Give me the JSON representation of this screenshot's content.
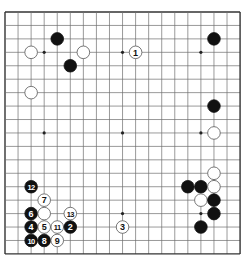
{
  "board": {
    "size": 19,
    "origin_x": 5,
    "origin_y": 12,
    "spacing_x": 13.06,
    "spacing_y": 13.44,
    "line_color": "#6e6e6e",
    "border_color": "#333333",
    "star_points": [
      [
        3,
        3
      ],
      [
        9,
        3
      ],
      [
        15,
        3
      ],
      [
        3,
        9
      ],
      [
        9,
        9
      ],
      [
        15,
        9
      ],
      [
        3,
        15
      ],
      [
        9,
        15
      ],
      [
        15,
        15
      ]
    ]
  },
  "colors": {
    "black": "#111111",
    "white": "#ffffff",
    "stone_outline": "#555555"
  },
  "stones": [
    {
      "color": "black",
      "col": 4,
      "row": 2,
      "label": ""
    },
    {
      "color": "white",
      "col": 2,
      "row": 3,
      "label": ""
    },
    {
      "color": "white",
      "col": 6,
      "row": 3,
      "label": ""
    },
    {
      "color": "black",
      "col": 5,
      "row": 4,
      "label": ""
    },
    {
      "color": "white",
      "col": 2,
      "row": 6,
      "label": ""
    },
    {
      "color": "white",
      "col": 10,
      "row": 3,
      "label": "1"
    },
    {
      "color": "black",
      "col": 16,
      "row": 2,
      "label": ""
    },
    {
      "color": "black",
      "col": 16,
      "row": 7,
      "label": ""
    },
    {
      "color": "white",
      "col": 16,
      "row": 9,
      "label": ""
    },
    {
      "color": "white",
      "col": 16,
      "row": 12,
      "label": ""
    },
    {
      "color": "black",
      "col": 14,
      "row": 13,
      "label": ""
    },
    {
      "color": "black",
      "col": 15,
      "row": 13,
      "label": ""
    },
    {
      "color": "white",
      "col": 16,
      "row": 13,
      "label": ""
    },
    {
      "color": "white",
      "col": 15,
      "row": 14,
      "label": ""
    },
    {
      "color": "black",
      "col": 16,
      "row": 14,
      "label": ""
    },
    {
      "color": "black",
      "col": 16,
      "row": 15,
      "label": ""
    },
    {
      "color": "black",
      "col": 15,
      "row": 16,
      "label": ""
    },
    {
      "color": "black",
      "col": 2,
      "row": 13,
      "label": "12"
    },
    {
      "color": "white",
      "col": 3,
      "row": 14,
      "label": "7"
    },
    {
      "color": "black",
      "col": 2,
      "row": 15,
      "label": "6"
    },
    {
      "color": "white",
      "col": 3,
      "row": 15,
      "label": ""
    },
    {
      "color": "white",
      "col": 5,
      "row": 15,
      "label": "13"
    },
    {
      "color": "black",
      "col": 2,
      "row": 16,
      "label": "4"
    },
    {
      "color": "white",
      "col": 3,
      "row": 16,
      "label": "5"
    },
    {
      "color": "white",
      "col": 4,
      "row": 16,
      "label": "11"
    },
    {
      "color": "black",
      "col": 5,
      "row": 16,
      "label": "2"
    },
    {
      "color": "black",
      "col": 2,
      "row": 17,
      "label": "10"
    },
    {
      "color": "black",
      "col": 3,
      "row": 17,
      "label": "8"
    },
    {
      "color": "white",
      "col": 4,
      "row": 17,
      "label": "9"
    },
    {
      "color": "white",
      "col": 9,
      "row": 16,
      "label": "3"
    }
  ]
}
